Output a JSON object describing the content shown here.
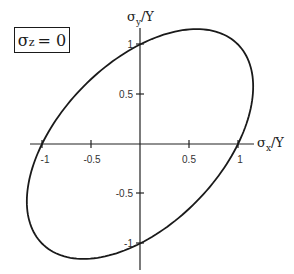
{
  "chart_data": {
    "type": "line",
    "title": "",
    "annotation": "σz = 0",
    "annotation_parts": {
      "symbol": "σ",
      "subscript": "z",
      "rhs": "= 0"
    },
    "xlabel": "σx/Y",
    "ylabel": "σy/Y",
    "xlabel_parts": {
      "symbol": "σ",
      "subscript": "x",
      "rest": "/Y"
    },
    "ylabel_parts": {
      "symbol": "σ",
      "subscript": "y",
      "rest": "/Y"
    },
    "xlim": [
      -1.15,
      1.15
    ],
    "ylim": [
      -1.15,
      1.15
    ],
    "x_ticks": [
      -1,
      -0.5,
      0.5,
      1
    ],
    "x_tick_labels": [
      "-1",
      "-0.5",
      "0.5",
      "1"
    ],
    "y_ticks": [
      1,
      0.5,
      -0.5,
      -1
    ],
    "y_tick_labels": [
      "1",
      "0.5",
      "-0.5",
      "-1"
    ],
    "grid": false,
    "legend": null,
    "series": [
      {
        "name": "von Mises yield ellipse (σx² − σxσy + σy² = Y²)",
        "equation": "x^2 - x*y + y^2 = 1",
        "points_sample": [
          {
            "x": 1,
            "y": 0
          },
          {
            "x": 1.155,
            "y": 0.577
          },
          {
            "x": 1,
            "y": 1
          },
          {
            "x": 0.577,
            "y": 1.155
          },
          {
            "x": 0,
            "y": 1
          },
          {
            "x": -0.577,
            "y": 0.577
          },
          {
            "x": -1,
            "y": 0
          },
          {
            "x": -1.155,
            "y": -0.577
          },
          {
            "x": -1,
            "y": -1
          },
          {
            "x": -0.577,
            "y": -1.155
          },
          {
            "x": 0,
            "y": -1
          },
          {
            "x": 0.577,
            "y": -0.577
          }
        ],
        "color": "#1a1a1a"
      }
    ]
  }
}
